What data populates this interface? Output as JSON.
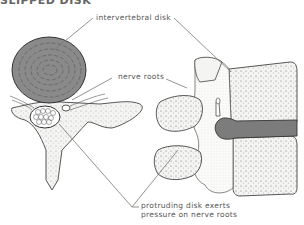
{
  "title": "SLIPPED DISK",
  "labels": {
    "intervertebral_disk": "intervertebral disk",
    "nerve_roots": "nerve roots",
    "protruding_line1": "protruding disk exerts",
    "protruding_line2": "pressure on nerve roots"
  },
  "colors": {
    "disk_fill": "#8a8a8a",
    "bone_fill": "#f4f4f2",
    "outline": "#444444",
    "leader": "#777777",
    "text": "#555555"
  }
}
